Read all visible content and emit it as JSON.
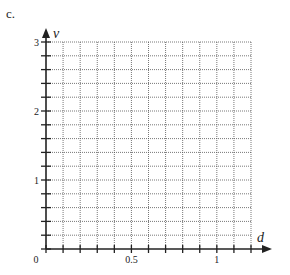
{
  "panel": {
    "label": "c."
  },
  "chart_data": {
    "type": "line",
    "title": "",
    "xlabel": "d",
    "ylabel": "v",
    "xlim": [
      0,
      1.2
    ],
    "ylim": [
      0,
      3
    ],
    "x_ticks": [
      0,
      0.1,
      0.2,
      0.3,
      0.4,
      0.5,
      0.6,
      0.7,
      0.8,
      0.9,
      1.0,
      1.1,
      1.2
    ],
    "x_tick_labels": [
      {
        "value": 0,
        "label": "0"
      },
      {
        "value": 0.5,
        "label": "0.5"
      },
      {
        "value": 1,
        "label": "1"
      }
    ],
    "y_ticks": [
      0,
      0.2,
      0.4,
      0.6,
      0.8,
      1.0,
      1.2,
      1.4,
      1.6,
      1.8,
      2.0,
      2.2,
      2.4,
      2.6,
      2.8,
      3.0
    ],
    "y_tick_labels": [
      {
        "value": 1,
        "label": "1"
      },
      {
        "value": 2,
        "label": "2"
      },
      {
        "value": 3,
        "label": "3"
      }
    ],
    "grid": true,
    "grid_style": "dotted",
    "series": []
  }
}
